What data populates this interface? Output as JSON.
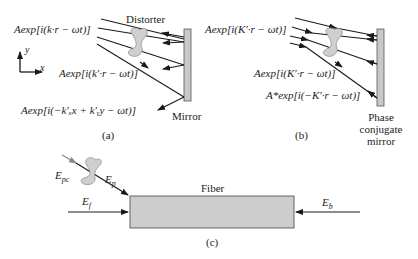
{
  "figure": {
    "panel_a": {
      "caption": "(a)",
      "incident_wave": "Aexp[i(k·r − ωt)]",
      "distorted_wave": "Aexp[i(k′·r − ωt)]",
      "reflected_wave": "Aexp[i(−k′ₓx + k′ᵧy − ωt)]",
      "distorter_label": "Distorter",
      "mirror_label": "Mirror",
      "axis_y": "y",
      "axis_x": "x"
    },
    "panel_b": {
      "caption": "(b)",
      "incident_wave": "Aexp[i(K′·r − ωt)]",
      "distorted_wave": "Aexp[i(K′·r − ωt)]",
      "conjugate_wave": "A*exp[i(−K′·r − ωt)]",
      "mirror_label_line1": "Phase",
      "mirror_label_line2": "conjugate",
      "mirror_label_line3": "mirror"
    },
    "panel_c": {
      "caption": "(c)",
      "fiber_label": "Fiber",
      "e_pc": "E",
      "e_pc_sub": "pc",
      "e_p": "E",
      "e_p_sub": "p",
      "e_f": "E",
      "e_f_sub": "f",
      "e_b": "E",
      "e_b_sub": "b"
    },
    "colors": {
      "line": "#1a1a1a",
      "mirror_fill": "#c8c8c8",
      "distorter_fill": "#cfcfcf",
      "fiber_fill": "#cdcdcd",
      "pc_arrow": "#888888"
    }
  }
}
